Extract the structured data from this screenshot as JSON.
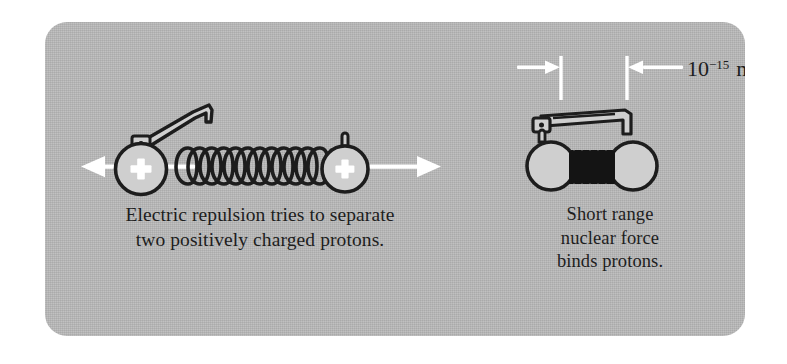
{
  "figure": {
    "panel_bg_color": "#b9b9b9",
    "ink_color": "#1d1d1d",
    "highlight_color": "#ffffff"
  },
  "left_scene": {
    "name": "electric-repulsion",
    "caption_lines": [
      "Electric repulsion tries to separate",
      "two positively charged protons."
    ],
    "proton_charge_symbol": "+",
    "proton_count": 2,
    "spring_state": "stretched",
    "spring_coils": 12,
    "force_arrows": [
      {
        "direction": "left",
        "label": ""
      },
      {
        "direction": "right",
        "label": ""
      }
    ]
  },
  "right_scene": {
    "name": "nuclear-binding",
    "caption_lines": [
      "Short range",
      "nuclear force",
      "binds protons."
    ],
    "proton_count": 2,
    "spring_state": "compressed",
    "dimension": {
      "mantissa": "10",
      "exponent": "−15",
      "unit": "m",
      "full_label": "10⁻¹⁵ m"
    }
  }
}
